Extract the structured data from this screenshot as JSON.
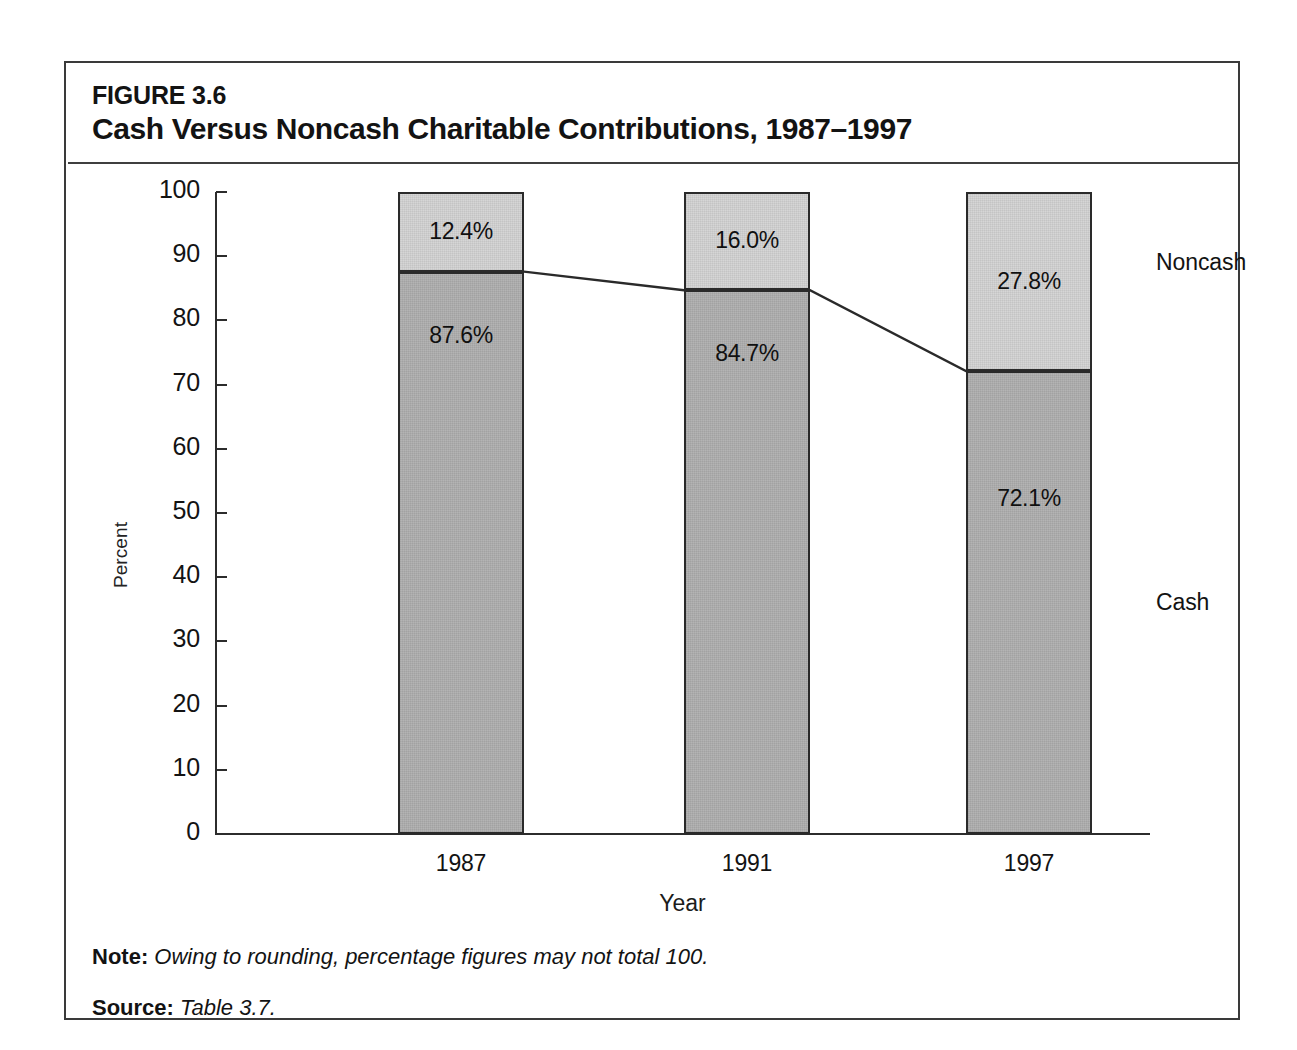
{
  "figure": {
    "number": "FIGURE 3.6",
    "title": "Cash Versus Noncash Charitable Contributions, 1987–1997"
  },
  "notes": {
    "note_key": "Note:",
    "note_value": "Owing to rounding, percentage figures may not total 100.",
    "source_key": "Source:",
    "source_value": "Table 3.7."
  },
  "legend": {
    "noncash": "Noncash",
    "cash": "Cash"
  },
  "chart_data": {
    "type": "bar",
    "subtype": "stacked-100-percent-with-trend-line",
    "title": "Cash Versus Noncash Charitable Contributions, 1987–1997",
    "xlabel": "Year",
    "ylabel": "Percent",
    "categories": [
      "1987",
      "1991",
      "1997"
    ],
    "ylim": [
      0,
      100
    ],
    "yticks": [
      0,
      10,
      20,
      30,
      40,
      50,
      60,
      70,
      80,
      90,
      100
    ],
    "ytick_labels": [
      "0",
      "10",
      "20",
      "30",
      "40",
      "50",
      "60",
      "70",
      "80",
      "90",
      "100"
    ],
    "grid": false,
    "legend_position": "right",
    "series": [
      {
        "name": "Cash",
        "values": [
          87.6,
          84.7,
          72.1
        ],
        "labels": [
          "87.6%",
          "84.7%",
          "72.1%"
        ],
        "color": "#b4b4b4"
      },
      {
        "name": "Noncash",
        "values": [
          12.4,
          16.0,
          27.8
        ],
        "labels": [
          "12.4%",
          "16.0%",
          "27.8%"
        ],
        "color": "#d6d6d6"
      }
    ],
    "trend_line": {
      "name": "Cash share boundary",
      "values": [
        87.6,
        84.7,
        72.1
      ],
      "color": "#2a2a2a"
    }
  }
}
